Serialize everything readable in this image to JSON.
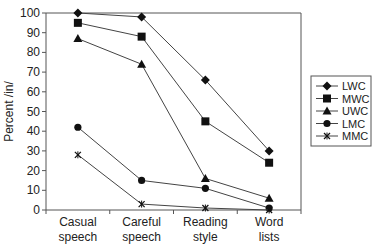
{
  "chart_data": {
    "type": "line",
    "title": "",
    "xlabel": "",
    "ylabel": "Percent /in/",
    "ylim": [
      0,
      100
    ],
    "yticks": [
      0,
      10,
      20,
      30,
      40,
      50,
      60,
      70,
      80,
      90,
      100
    ],
    "grid": false,
    "legend_position": "right",
    "categories": [
      [
        "Casual",
        "speech"
      ],
      [
        "Careful",
        "speech"
      ],
      [
        "Reading",
        "style"
      ],
      [
        "Word",
        "lists"
      ]
    ],
    "series": [
      {
        "name": "LWC",
        "marker": "diamond",
        "values": [
          100,
          98,
          66,
          30
        ]
      },
      {
        "name": "MWC",
        "marker": "square",
        "values": [
          95,
          88,
          45,
          24
        ]
      },
      {
        "name": "UWC",
        "marker": "triangle",
        "values": [
          87,
          74,
          16,
          6
        ]
      },
      {
        "name": "LMC",
        "marker": "circle",
        "values": [
          42,
          15,
          11,
          1
        ]
      },
      {
        "name": "MMC",
        "marker": "star",
        "values": [
          28,
          3,
          1,
          0
        ]
      }
    ]
  }
}
